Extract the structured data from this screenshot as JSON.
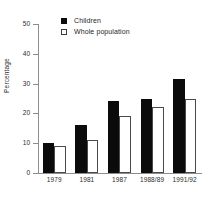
{
  "chart_data": {
    "type": "bar",
    "title": "",
    "subtitle": "",
    "xlabel": "",
    "ylabel": "Percentage",
    "categories": [
      "1979",
      "1981",
      "1987",
      "1988/89",
      "1991/92"
    ],
    "series": [
      {
        "name": "Children",
        "values": [
          10,
          16,
          24,
          25,
          31.5
        ],
        "color": "#0b0b0b",
        "style": "filled"
      },
      {
        "name": "Whole population",
        "values": [
          9,
          11,
          19,
          22,
          24.7
        ],
        "color": "#ffffff",
        "style": "outlined"
      }
    ],
    "ylim": [
      0,
      50
    ],
    "yticks": [
      0,
      10,
      20,
      30,
      40,
      50
    ],
    "ytick_labels": [
      "0",
      "10",
      "20",
      "30",
      "40",
      "50"
    ],
    "grid": false,
    "legend_position": "upper left"
  },
  "legend": {
    "items": [
      {
        "label": "Children",
        "swatch": "filled-square-icon"
      },
      {
        "label": "Whole population",
        "swatch": "hollow-square-icon"
      }
    ]
  },
  "axes": {
    "y_title": "Percentage"
  },
  "colors": {
    "children_bar": "#0b0b0b",
    "whole_population_bar": "#ffffff",
    "whole_population_border": "#4a4a4a",
    "axis": "#8d8d8d",
    "text": "#2b2b2b",
    "background": "#ffffff"
  }
}
